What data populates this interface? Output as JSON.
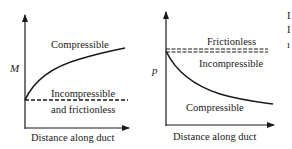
{
  "panels": [
    {
      "id": "mach",
      "y_label": "M",
      "x_label": "Distance along duct",
      "curves": [
        {
          "name": "compressible",
          "label": "Compressible",
          "style": "solid",
          "trend": "increasing"
        },
        {
          "name": "incompressible",
          "label_line1": "Incompressible",
          "label_line2": "and frictionless",
          "style": "dashed",
          "trend": "constant"
        }
      ]
    },
    {
      "id": "pressure",
      "y_label": "p",
      "x_label": "Distance along duct",
      "curves": [
        {
          "name": "frictionless",
          "label": "Frictionless",
          "style": "dashed",
          "trend": "constant"
        },
        {
          "name": "incompressible",
          "label": "Incompressible",
          "style": "dashed",
          "trend": "constant"
        },
        {
          "name": "compressible",
          "label": "Compressible",
          "style": "solid",
          "trend": "decreasing"
        }
      ]
    }
  ],
  "colors": {
    "ink": "#1a1a1a",
    "background": "#ffffff"
  },
  "edge_fragments": [
    "I",
    "I",
    "ı"
  ]
}
